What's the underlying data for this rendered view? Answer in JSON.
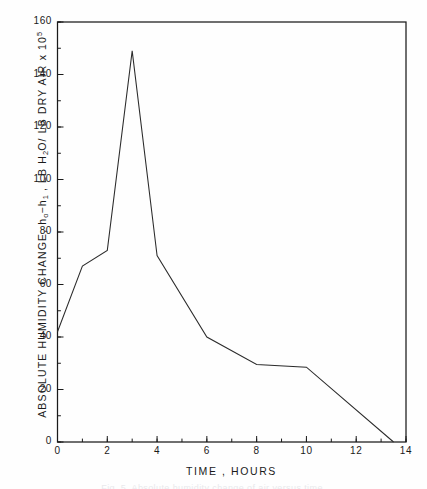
{
  "figure": {
    "background_color": "#fefefe",
    "line_color": "#2b2b2b",
    "axis_color": "#1a1a1a",
    "caption": "Fig. 5.  Absolute humidity change of air versus time."
  },
  "chart_data": {
    "type": "line",
    "title": "",
    "subtitle": "",
    "xlabel": "TIME ,   HOURS",
    "ylabel": "ABSOLUTE HUMIDITY CHANGE,   h₀−h₁ ,  LB H₂O/ LB DRY AIR x 10⁵",
    "ylabel_parts": {
      "lead": "ABSOLUTE  HUMIDITY  CHANGE,   h",
      "sub_o": "o",
      "dash": "−h",
      "sub_i": "1",
      "tail": " ,  LB  H",
      "sub_2": "2",
      "tail2": "O/ LB  DRY  AIR  x  10",
      "sup_5": "5"
    },
    "xlim": [
      0,
      14
    ],
    "ylim": [
      0,
      160
    ],
    "x_major_step": 2,
    "x_minor_step": 1,
    "y_major_step": 20,
    "y_minor_step": 10,
    "xticks": [
      0,
      2,
      4,
      6,
      8,
      10,
      12,
      14
    ],
    "xtick_labels": [
      "0",
      "2",
      "4",
      "6",
      "8",
      "10",
      "12",
      "14"
    ],
    "yticks": [
      0,
      20,
      40,
      60,
      80,
      100,
      120,
      140,
      160
    ],
    "ytick_labels": [
      "0",
      "20",
      "40",
      "60",
      "80",
      "100",
      "120",
      "140",
      "160"
    ],
    "grid": false,
    "legend": false,
    "legend_position": "none",
    "series": [
      {
        "name": "absolute humidity change",
        "x": [
          0,
          1,
          2,
          3,
          4,
          6,
          8,
          10,
          13.5
        ],
        "values": [
          42,
          67,
          73,
          149,
          71,
          40,
          29.5,
          28.5,
          0
        ]
      }
    ]
  }
}
